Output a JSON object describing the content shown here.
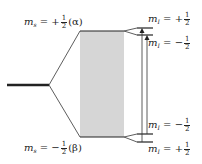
{
  "diagram": {
    "type": "energy-level-splitting",
    "electron_levels": {
      "upper": {
        "symbol": "m",
        "subscript": "s",
        "sign": "+",
        "num": "1",
        "den": "2",
        "state": "(α)"
      },
      "lower": {
        "symbol": "m",
        "subscript": "s",
        "sign": "−",
        "num": "1",
        "den": "2",
        "state": "(β)"
      }
    },
    "nuclear_levels": {
      "upper_top": {
        "symbol": "m",
        "subscript": "I",
        "sign": "+",
        "num": "1",
        "den": "2"
      },
      "upper_bottom": {
        "symbol": "m",
        "subscript": "I",
        "sign": "−",
        "num": "1",
        "den": "2"
      },
      "lower_top": {
        "symbol": "m",
        "subscript": "I",
        "sign": "−",
        "num": "1",
        "den": "2"
      },
      "lower_bottom": {
        "symbol": "m",
        "subscript": "I",
        "sign": "+",
        "num": "1",
        "den": "2"
      }
    },
    "colors": {
      "line": "#222222",
      "band": "#d6d6d6"
    }
  }
}
